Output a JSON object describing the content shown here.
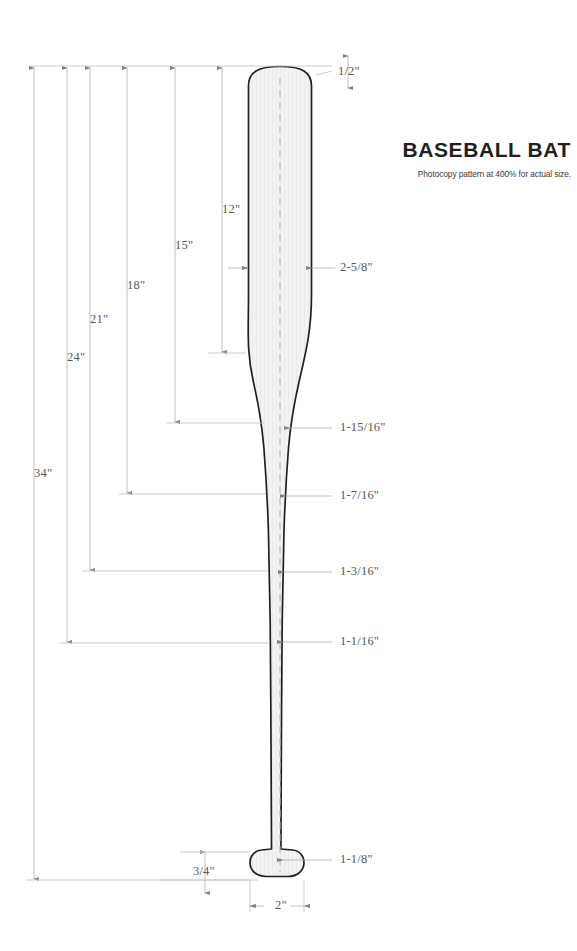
{
  "document": {
    "title": "BASEBALL BAT",
    "subtitle": "Photocopy pattern at 400% for actual size.",
    "accent_color": "#231f20",
    "line_color": "#a7a9ac",
    "fill_color": "#f1f1f1"
  },
  "diagram": {
    "object_name": "baseball-bat-pattern",
    "width_dimensions": [
      {
        "id": "top-cap",
        "label": "1/2\"",
        "x": 338,
        "y": 72,
        "orientation": "vertical-measure"
      },
      {
        "id": "barrel",
        "label": "2-5/8\"",
        "x": 340,
        "y": 268,
        "orientation": "horizontal-measure"
      },
      {
        "id": "taper-upper",
        "label": "1-15/16\"",
        "x": 340,
        "y": 428,
        "orientation": "horizontal-measure"
      },
      {
        "id": "taper-mid",
        "label": "1-7/16\"",
        "x": 340,
        "y": 496,
        "orientation": "horizontal-measure"
      },
      {
        "id": "handle-upper",
        "label": "1-3/16\"",
        "x": 340,
        "y": 572,
        "orientation": "horizontal-measure"
      },
      {
        "id": "handle-lower",
        "label": "1-1/16\"",
        "x": 340,
        "y": 642,
        "orientation": "horizontal-measure"
      },
      {
        "id": "knob-neck",
        "label": "1-1/8\"",
        "x": 340,
        "y": 860,
        "orientation": "horizontal-measure"
      },
      {
        "id": "knob-height",
        "label": "3/4\"",
        "x": 193,
        "y": 872,
        "orientation": "vertical-measure"
      },
      {
        "id": "knob-width",
        "label": "2\"",
        "x": 275,
        "y": 906,
        "orientation": "horizontal-measure"
      }
    ],
    "length_dimensions": [
      {
        "id": "len-12",
        "label": "12\"",
        "x": 222,
        "y": 210,
        "from_y": 66,
        "to_y": 353
      },
      {
        "id": "len-15",
        "label": "15\"",
        "x": 175,
        "y": 246,
        "from_y": 66,
        "to_y": 423
      },
      {
        "id": "len-18",
        "label": "18\"",
        "x": 127,
        "y": 286,
        "from_y": 66,
        "to_y": 494
      },
      {
        "id": "len-21",
        "label": "21\"",
        "x": 90,
        "y": 320,
        "from_y": 66,
        "to_y": 571
      },
      {
        "id": "len-24",
        "label": "24\"",
        "x": 67,
        "y": 358,
        "from_y": 66,
        "to_y": 643
      },
      {
        "id": "len-34",
        "label": "34\"",
        "x": 34,
        "y": 474,
        "from_y": 66,
        "to_y": 880
      }
    ]
  }
}
